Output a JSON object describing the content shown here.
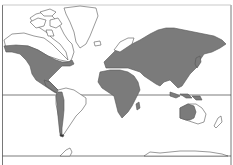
{
  "map": {
    "projection": "Mercator world map",
    "colors": {
      "background": "#ffffff",
      "shaded_land": "#7b7b7b",
      "unshaded_land": "#ffffff",
      "outline": "#555555",
      "grid_line": "#444444"
    },
    "lines": {
      "equator": "equator",
      "antarctic_line": "antarctic-line"
    },
    "shaded_regions": [
      "North America (western & central)",
      "Central America",
      "Andes / western South America",
      "Europe",
      "Africa",
      "Asia",
      "Madagascar",
      "Southeast Asia islands",
      "Western & central Australia",
      "Japan"
    ],
    "unshaded_regions": [
      "Greenland",
      "Canadian Arctic Archipelago",
      "Northern Canada",
      "Eastern South America",
      "Eastern Australia",
      "New Zealand",
      "Antarctica",
      "Scandinavia (northern)",
      "Arctic islands"
    ]
  }
}
